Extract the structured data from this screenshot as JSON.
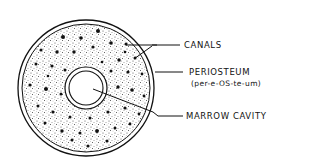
{
  "diagram": {
    "labels": {
      "canals": "CANALS",
      "periosteum": "PERIOSTEUM",
      "periosteum_pronunciation": "(per-e-OS-te-um)",
      "marrow_cavity": "MARROW CAVITY"
    },
    "colors": {
      "ink": "#111111",
      "background": "#ffffff"
    }
  }
}
